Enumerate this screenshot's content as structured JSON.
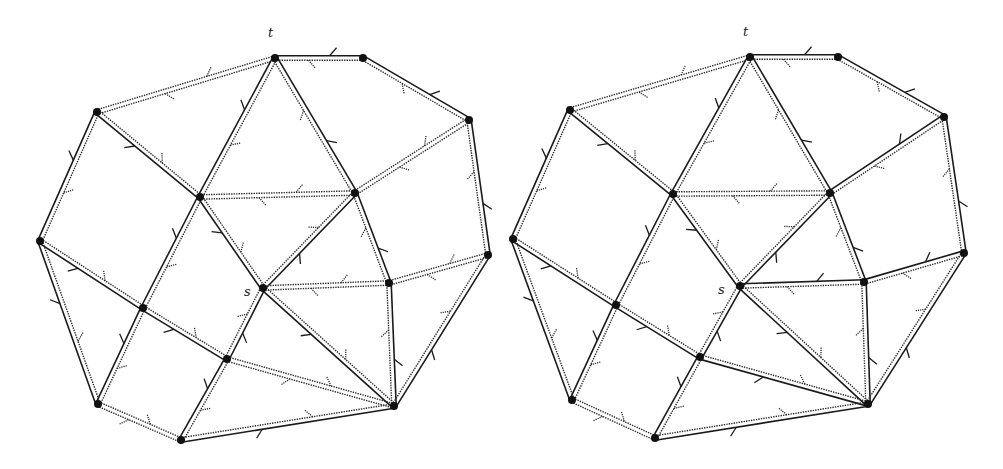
{
  "figure": {
    "background": "#ffffff",
    "ink": "#1a1a1a",
    "panels": [
      {
        "id": "left",
        "labels": [
          {
            "text": "t",
            "x": 268,
            "y": 37
          },
          {
            "text": "s",
            "x": 244,
            "y": 296
          }
        ],
        "nodes": {
          "t": [
            275,
            58
          ],
          "a": [
            363,
            58
          ],
          "b": [
            469,
            120
          ],
          "c": [
            97,
            112
          ],
          "d": [
            40,
            241
          ],
          "e": [
            200,
            197
          ],
          "f": [
            355,
            193
          ],
          "g": [
            488,
            255
          ],
          "h": [
            389,
            283
          ],
          "s": [
            263,
            288
          ],
          "i": [
            143,
            308
          ],
          "j": [
            227,
            359
          ],
          "k": [
            98,
            404
          ],
          "l": [
            181,
            440
          ],
          "m": [
            394,
            406
          ]
        },
        "edges": [
          {
            "u": "a",
            "v": "t",
            "style": "solid"
          },
          {
            "u": "b",
            "v": "a",
            "style": "solid"
          },
          {
            "u": "t",
            "v": "c",
            "style": "dotted"
          },
          {
            "u": "t",
            "v": "e",
            "style": "solid"
          },
          {
            "u": "f",
            "v": "t",
            "style": "solid"
          },
          {
            "u": "c",
            "v": "d",
            "style": "solid"
          },
          {
            "u": "c",
            "v": "e",
            "style": "solid"
          },
          {
            "u": "f",
            "v": "e",
            "style": "dotted"
          },
          {
            "u": "b",
            "v": "f",
            "style": "dotted"
          },
          {
            "u": "g",
            "v": "b",
            "style": "solid"
          },
          {
            "u": "e",
            "v": "i",
            "style": "solid"
          },
          {
            "u": "e",
            "v": "s",
            "style": "solid"
          },
          {
            "u": "s",
            "v": "f",
            "style": "solid"
          },
          {
            "u": "h",
            "v": "f",
            "style": "solid"
          },
          {
            "u": "h",
            "v": "s",
            "style": "dotted"
          },
          {
            "u": "g",
            "v": "h",
            "style": "dotted"
          },
          {
            "u": "d",
            "v": "i",
            "style": "solid"
          },
          {
            "u": "d",
            "v": "k",
            "style": "solid"
          },
          {
            "u": "i",
            "v": "j",
            "style": "solid"
          },
          {
            "u": "i",
            "v": "k",
            "style": "solid"
          },
          {
            "u": "j",
            "v": "s",
            "style": "solid"
          },
          {
            "u": "s",
            "v": "m",
            "style": "solid"
          },
          {
            "u": "j",
            "v": "m",
            "style": "dotted"
          },
          {
            "u": "m",
            "v": "h",
            "style": "solid"
          },
          {
            "u": "m",
            "v": "g",
            "style": "solid"
          },
          {
            "u": "j",
            "v": "l",
            "style": "solid"
          },
          {
            "u": "k",
            "v": "l",
            "style": "dotted"
          },
          {
            "u": "l",
            "v": "m",
            "style": "solid"
          }
        ]
      },
      {
        "id": "right",
        "labels": [
          {
            "text": "t",
            "x": 743,
            "y": 36
          },
          {
            "text": "s",
            "x": 718,
            "y": 294
          }
        ],
        "nodes": {
          "t": [
            750,
            57
          ],
          "a": [
            838,
            57
          ],
          "b": [
            944,
            117
          ],
          "c": [
            570,
            110
          ],
          "d": [
            513,
            239
          ],
          "e": [
            673,
            194
          ],
          "f": [
            830,
            193
          ],
          "g": [
            964,
            253
          ],
          "h": [
            864,
            282
          ],
          "s": [
            740,
            286
          ],
          "i": [
            616,
            305
          ],
          "j": [
            700,
            357
          ],
          "k": [
            572,
            400
          ],
          "l": [
            655,
            438
          ],
          "m": [
            868,
            404
          ]
        },
        "edges": [
          {
            "u": "a",
            "v": "t",
            "style": "solid"
          },
          {
            "u": "b",
            "v": "a",
            "style": "solid"
          },
          {
            "u": "t",
            "v": "c",
            "style": "dotted"
          },
          {
            "u": "t",
            "v": "e",
            "style": "solid"
          },
          {
            "u": "f",
            "v": "t",
            "style": "solid"
          },
          {
            "u": "c",
            "v": "d",
            "style": "solid"
          },
          {
            "u": "c",
            "v": "e",
            "style": "solid"
          },
          {
            "u": "f",
            "v": "e",
            "style": "dotted"
          },
          {
            "u": "b",
            "v": "f",
            "style": "solid"
          },
          {
            "u": "g",
            "v": "b",
            "style": "solid"
          },
          {
            "u": "e",
            "v": "i",
            "style": "solid"
          },
          {
            "u": "e",
            "v": "s",
            "style": "solid"
          },
          {
            "u": "s",
            "v": "f",
            "style": "solid"
          },
          {
            "u": "h",
            "v": "f",
            "style": "solid"
          },
          {
            "u": "h",
            "v": "s",
            "style": "solid"
          },
          {
            "u": "g",
            "v": "h",
            "style": "solid"
          },
          {
            "u": "d",
            "v": "i",
            "style": "solid"
          },
          {
            "u": "d",
            "v": "k",
            "style": "solid"
          },
          {
            "u": "i",
            "v": "j",
            "style": "solid"
          },
          {
            "u": "i",
            "v": "k",
            "style": "solid"
          },
          {
            "u": "j",
            "v": "s",
            "style": "solid"
          },
          {
            "u": "s",
            "v": "m",
            "style": "solid"
          },
          {
            "u": "j",
            "v": "m",
            "style": "solid"
          },
          {
            "u": "m",
            "v": "h",
            "style": "solid"
          },
          {
            "u": "m",
            "v": "g",
            "style": "solid"
          },
          {
            "u": "j",
            "v": "l",
            "style": "solid"
          },
          {
            "u": "k",
            "v": "l",
            "style": "dotted"
          },
          {
            "u": "l",
            "v": "m",
            "style": "solid"
          }
        ]
      }
    ]
  }
}
